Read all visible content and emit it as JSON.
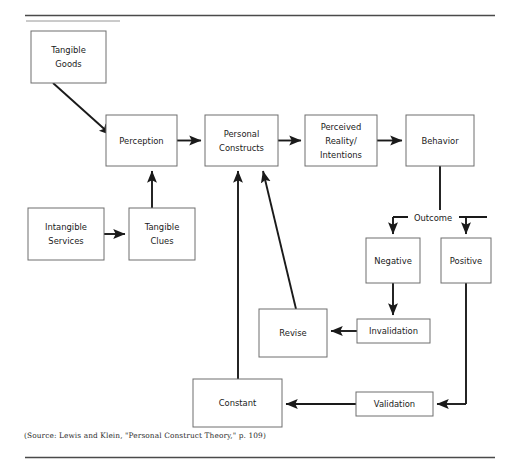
{
  "figure": {
    "source_note": "(Source: Lewis and Klein, \"Personal Construct Theory,\" p. 109)",
    "stroke_color": "#1a1a1a",
    "box_border_color": "#6e6e6e",
    "background_color": "#ffffff",
    "rule_color": "#4a4a4a"
  },
  "nodes": [
    {
      "id": "tangible_goods",
      "label_line1": "Tangible",
      "label_line2": "Goods",
      "x": 31,
      "y": 31,
      "w": 75,
      "h": 52
    },
    {
      "id": "perception",
      "label_line1": "Perception",
      "label_line2": "",
      "x": 106,
      "y": 115,
      "w": 71,
      "h": 51
    },
    {
      "id": "personal_constructs",
      "label_line1": "Personal",
      "label_line2": "Constructs",
      "x": 205,
      "y": 115,
      "w": 73,
      "h": 51
    },
    {
      "id": "perceived_reality",
      "label_line1": "Perceived",
      "label_line2": "Reality/",
      "label_line3": "Intentions",
      "x": 305,
      "y": 115,
      "w": 72,
      "h": 51
    },
    {
      "id": "behavior",
      "label_line1": "Behavior",
      "label_line2": "",
      "x": 406,
      "y": 115,
      "w": 68,
      "h": 51
    },
    {
      "id": "intangible_services",
      "label_line1": "Intangible",
      "label_line2": "Services",
      "x": 28,
      "y": 208,
      "w": 76,
      "h": 52
    },
    {
      "id": "tangible_clues",
      "label_line1": "Tangible",
      "label_line2": "Clues",
      "x": 129,
      "y": 208,
      "w": 66,
      "h": 52
    },
    {
      "id": "negative",
      "label_line1": "Negative",
      "label_line2": "",
      "x": 366,
      "y": 238,
      "w": 54,
      "h": 45
    },
    {
      "id": "positive",
      "label_line1": "Positive",
      "label_line2": "",
      "x": 441,
      "y": 238,
      "w": 50,
      "h": 45
    },
    {
      "id": "revise",
      "label_line1": "Revise",
      "label_line2": "",
      "x": 259,
      "y": 309,
      "w": 68,
      "h": 48
    },
    {
      "id": "invalidation",
      "label_line1": "Invalidation",
      "label_line2": "",
      "x": 357,
      "y": 319,
      "w": 73,
      "h": 24
    },
    {
      "id": "constant",
      "label_line1": "Constant",
      "label_line2": "",
      "x": 193,
      "y": 379,
      "w": 89,
      "h": 48
    },
    {
      "id": "validation",
      "label_line1": "Validation",
      "label_line2": "",
      "x": 356,
      "y": 392,
      "w": 77,
      "h": 24
    }
  ],
  "edges": [
    {
      "id": "goods-to-perception",
      "from": "tangible_goods",
      "to": "perception",
      "style": "diagonal",
      "arrow": true
    },
    {
      "id": "perception-to-constructs",
      "from": "perception",
      "to": "personal_constructs",
      "style": "horizontal",
      "arrow": true
    },
    {
      "id": "constructs-to-perceived-reality",
      "from": "personal_constructs",
      "to": "perceived_reality",
      "style": "horizontal",
      "arrow": true
    },
    {
      "id": "perceived-reality-to-behavior",
      "from": "perceived_reality",
      "to": "behavior",
      "style": "horizontal",
      "arrow": true
    },
    {
      "id": "services-to-clues",
      "from": "intangible_services",
      "to": "tangible_clues",
      "style": "horizontal",
      "arrow": true
    },
    {
      "id": "clues-to-perception",
      "from": "tangible_clues",
      "to": "perception",
      "style": "vertical",
      "arrow": true
    },
    {
      "id": "behavior-to-outcome-split",
      "from": "behavior",
      "to": "outcome",
      "style": "split",
      "arrow": true
    },
    {
      "id": "outcome-to-negative",
      "from": "outcome",
      "to": "negative",
      "style": "vertical",
      "arrow": true
    },
    {
      "id": "outcome-to-positive",
      "from": "outcome",
      "to": "positive",
      "style": "vertical",
      "arrow": true
    },
    {
      "id": "negative-to-invalidation",
      "from": "negative",
      "to": "invalidation",
      "style": "vertical",
      "arrow": true
    },
    {
      "id": "invalidation-to-revise",
      "from": "invalidation",
      "to": "revise",
      "style": "horizontal",
      "arrow": true
    },
    {
      "id": "revise-to-constructs",
      "from": "revise",
      "to": "personal_constructs",
      "style": "diagonal",
      "arrow": true
    },
    {
      "id": "positive-to-validation",
      "from": "positive",
      "to": "validation",
      "style": "elbow",
      "arrow": true
    },
    {
      "id": "validation-to-constant",
      "from": "validation",
      "to": "constant",
      "style": "horizontal",
      "arrow": true
    },
    {
      "id": "constant-to-constructs",
      "from": "constant",
      "to": "personal_constructs",
      "style": "vertical",
      "arrow": true
    }
  ],
  "edge_labels": [
    {
      "id": "outcome-label",
      "text": "Outcome",
      "x": 433,
      "y": 218
    }
  ]
}
